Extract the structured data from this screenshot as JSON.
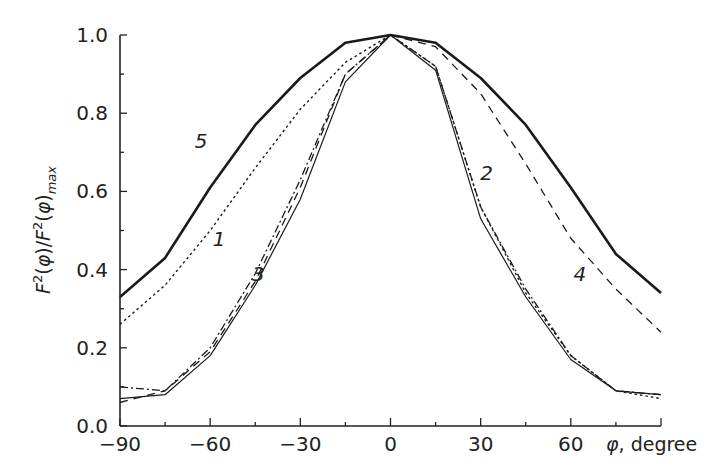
{
  "chart_data": {
    "type": "line",
    "title": "",
    "xlabel": "φ, degree",
    "ylabel": "F²(φ)/F²(φ)max",
    "xlim": [
      -90,
      90
    ],
    "ylim": [
      0.0,
      1.0
    ],
    "grid": false,
    "legend": "inline numeric labels on curves",
    "x_ticks": [
      "−90",
      "−60",
      "−30",
      "0",
      "30",
      "60"
    ],
    "y_ticks": [
      "0.0",
      "0.2",
      "0.4",
      "0.6",
      "0.8",
      "1.0"
    ],
    "x": [
      -90,
      -75,
      -60,
      -45,
      -30,
      -15,
      0,
      15,
      30,
      45,
      60,
      75,
      90
    ],
    "series": [
      {
        "name": "1",
        "style": "dotted",
        "values": [
          0.26,
          0.36,
          0.5,
          0.66,
          0.81,
          0.93,
          1.0,
          0.92,
          0.56,
          0.34,
          0.18,
          0.09,
          0.07
        ]
      },
      {
        "name": "2",
        "style": "dash-dot",
        "values": [
          0.1,
          0.09,
          0.2,
          0.39,
          0.63,
          0.9,
          1.0,
          0.92,
          0.56,
          0.35,
          0.18,
          0.09,
          0.08
        ]
      },
      {
        "name": "3",
        "style": "thin-solid",
        "values": [
          0.07,
          0.08,
          0.18,
          0.36,
          0.58,
          0.88,
          1.0,
          0.91,
          0.53,
          0.33,
          0.17,
          0.09,
          0.08
        ]
      },
      {
        "name": "4",
        "style": "dashed",
        "values": [
          0.06,
          0.09,
          0.19,
          0.37,
          0.61,
          0.9,
          1.0,
          0.97,
          0.85,
          0.67,
          0.48,
          0.35,
          0.24
        ]
      },
      {
        "name": "5",
        "style": "thick-solid",
        "values": [
          0.33,
          0.43,
          0.61,
          0.77,
          0.89,
          0.98,
          1.0,
          0.98,
          0.89,
          0.77,
          0.61,
          0.44,
          0.34
        ]
      }
    ],
    "annotations": [
      {
        "text": "5",
        "x": -63,
        "y": 0.71
      },
      {
        "text": "1",
        "x": -57,
        "y": 0.46
      },
      {
        "text": "3",
        "x": -44,
        "y": 0.37
      },
      {
        "text": "2",
        "x": 32,
        "y": 0.63
      },
      {
        "text": "4",
        "x": 63,
        "y": 0.37
      }
    ]
  },
  "axes": {
    "x_title_phi": "φ",
    "x_title_rest": ", degree"
  }
}
